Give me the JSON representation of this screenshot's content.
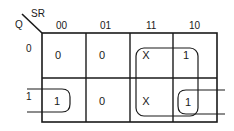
{
  "kmap": {
    "row_variable": "Q",
    "col_variable": "SR",
    "col_headers": [
      "00",
      "01",
      "11",
      "10"
    ],
    "row_headers": [
      "0",
      "1"
    ],
    "cells": [
      [
        "0",
        "0",
        "X",
        "1"
      ],
      [
        "1",
        "0",
        "X",
        "1"
      ]
    ],
    "groups": [
      {
        "name": "group-11-10-column-pair",
        "covers": "columns 11 and 10, both rows"
      },
      {
        "name": "group-row1-wraparound",
        "covers": "row 1, columns 00 and 10 (wrap-around)"
      }
    ],
    "line_color": "#1a1a1a"
  }
}
